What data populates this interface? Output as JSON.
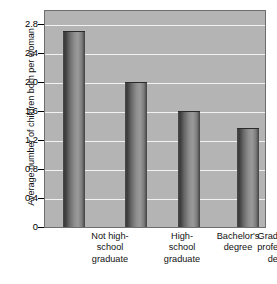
{
  "chart_data": {
    "type": "bar",
    "title": "",
    "xlabel": "",
    "ylabel": "Average number of children born per woman",
    "categories": [
      "Not high-school graduate",
      "High-school graduate",
      "Bachelor's degree",
      "Graduate or professional degree"
    ],
    "category_lines": [
      [
        "Not high-",
        "school",
        "graduate"
      ],
      [
        "High-",
        "school",
        "graduate"
      ],
      [
        "Bachelor's",
        "degree"
      ],
      [
        "Graduate or",
        "professional",
        "degree"
      ]
    ],
    "values": [
      2.7,
      2.0,
      1.6,
      1.36
    ],
    "ylim": [
      0,
      3.0
    ],
    "yticks": [
      0,
      0.4,
      0.8,
      1.2,
      1.6,
      2.0,
      2.4,
      2.8
    ],
    "ytick_labels": [
      "0",
      "0.4",
      "0.8",
      "1.2",
      "1.6",
      "2.0",
      "2.4",
      "2.8"
    ],
    "grid": true,
    "legend": false,
    "colors": {
      "plot_background": "#b4b4b4",
      "gridline": "#f2f2f2",
      "bar_dark": "#3a3a3a",
      "bar_light": "#9a9a9a",
      "axis": "#6e6e6e",
      "text": "#111111",
      "page_background": "#ffffff"
    }
  }
}
